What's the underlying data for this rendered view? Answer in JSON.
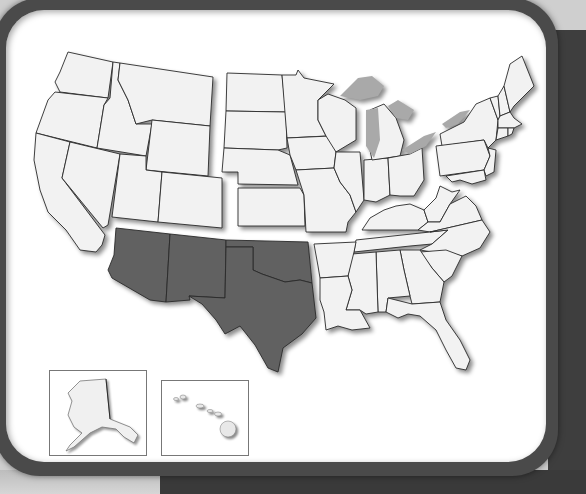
{
  "map": {
    "title": "United States regions",
    "highlighted_region": "Southwest",
    "colors": {
      "highlight": "#616161",
      "state_fill": "#f2f2f2",
      "lakes": "#a9a9a9",
      "card": "#ffffff",
      "frame": "#4a4a4a",
      "background": "#cfcfcf"
    },
    "regions": [
      {
        "name": "West",
        "highlighted": false,
        "states": [
          "WA",
          "OR",
          "CA",
          "NV",
          "ID",
          "MT",
          "WY",
          "UT",
          "CO"
        ]
      },
      {
        "name": "Southwest",
        "highlighted": true,
        "states": [
          "AZ",
          "NM",
          "TX",
          "OK"
        ]
      },
      {
        "name": "Midwest",
        "highlighted": false,
        "states": [
          "ND",
          "SD",
          "NE",
          "KS",
          "MN",
          "IA",
          "MO",
          "WI",
          "IL",
          "MI",
          "IN",
          "OH"
        ]
      },
      {
        "name": "Northeast",
        "highlighted": false,
        "states": [
          "ME",
          "NH",
          "VT",
          "MA",
          "RI",
          "CT",
          "NY",
          "PA",
          "NJ",
          "DE",
          "MD"
        ]
      },
      {
        "name": "Southeast",
        "highlighted": false,
        "states": [
          "WV",
          "VA",
          "KY",
          "TN",
          "NC",
          "SC",
          "GA",
          "FL",
          "AL",
          "MS",
          "AR",
          "LA"
        ]
      }
    ],
    "insets": [
      {
        "name": "Alaska",
        "highlighted": false
      },
      {
        "name": "Hawaii",
        "highlighted": false
      }
    ]
  }
}
